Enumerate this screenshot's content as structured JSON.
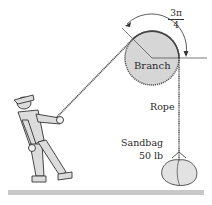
{
  "figure": {
    "labels": {
      "branch": "Branch",
      "rope": "Rope",
      "sandbag": "Sandbag",
      "weight": "50 lb"
    },
    "angle": {
      "numerator": "3π",
      "denominator": "4"
    }
  },
  "colors": {
    "branch_fill": "#d6d6d6",
    "ground": "#c8c8c8",
    "figure_fill": "#dcdcdc",
    "line": "#333333"
  }
}
